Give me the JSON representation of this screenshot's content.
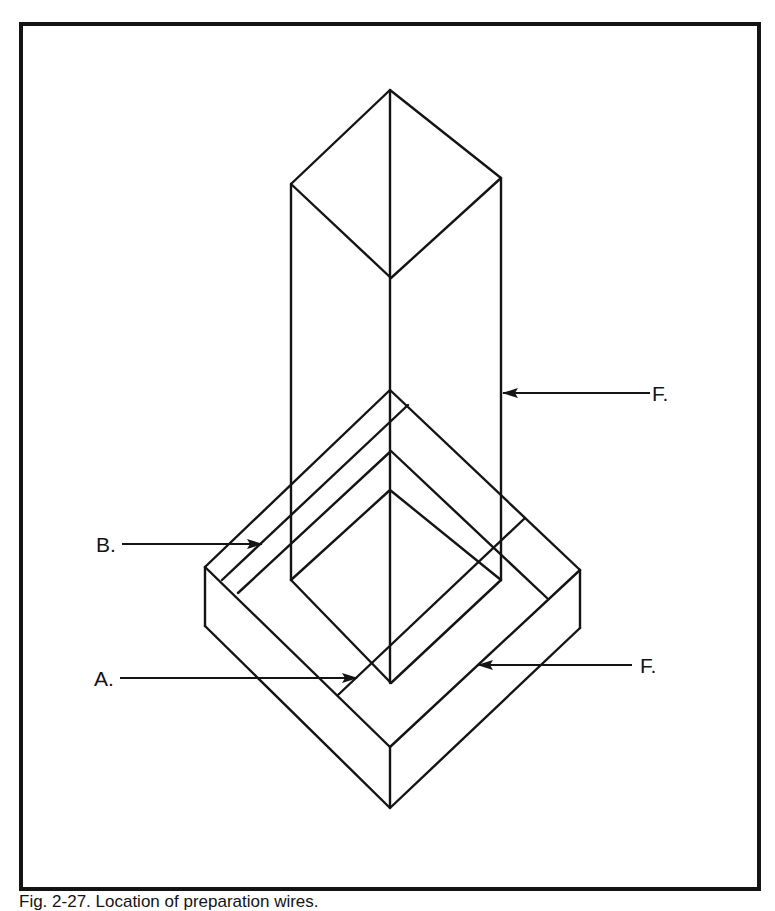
{
  "figure": {
    "caption": "Fig. 2-27. Location of preparation wires.",
    "labels": {
      "f_upper": "F.",
      "b": "B.",
      "a": "A.",
      "f_lower": "F."
    },
    "colors": {
      "line": "#141414",
      "background": "#ffffff"
    }
  }
}
